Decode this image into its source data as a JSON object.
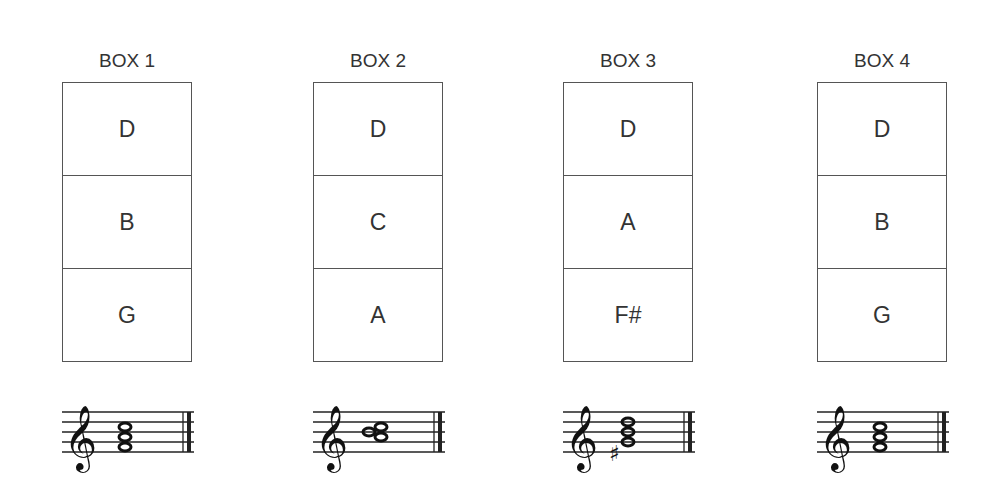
{
  "boxes": [
    {
      "title": "BOX 1",
      "notes": [
        "D",
        "B",
        "G"
      ],
      "chord_notes": [
        "G4",
        "B4",
        "D5"
      ]
    },
    {
      "title": "BOX 2",
      "notes": [
        "D",
        "C",
        "A"
      ],
      "chord_notes": [
        "A4",
        "C5",
        "D5"
      ]
    },
    {
      "title": "BOX 3",
      "notes": [
        "D",
        "A",
        "F#"
      ],
      "chord_notes": [
        "F#4",
        "A4",
        "D5"
      ]
    },
    {
      "title": "BOX 4",
      "notes": [
        "D",
        "B",
        "G"
      ],
      "chord_notes": [
        "G4",
        "B4",
        "D5"
      ]
    }
  ]
}
